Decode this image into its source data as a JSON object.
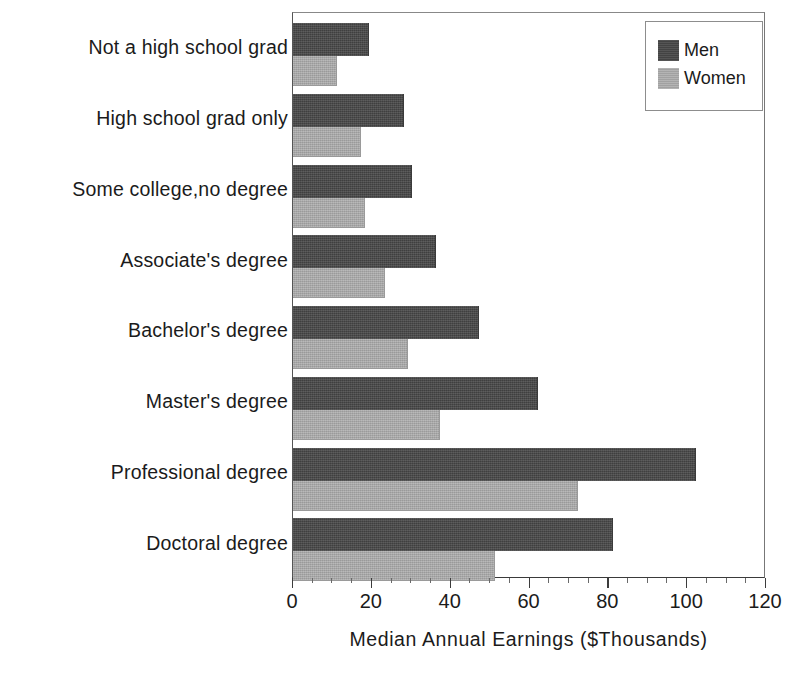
{
  "chart_data": {
    "type": "bar",
    "orientation": "horizontal",
    "title": "",
    "subtitle": "",
    "xlabel": "Median Annual Earnings  ($Thousands)",
    "ylabel": "",
    "xlim": [
      0,
      120
    ],
    "xticks": [
      0,
      20,
      40,
      60,
      80,
      100,
      120
    ],
    "xtick_labels": [
      "0",
      "20",
      "40",
      "60",
      "80",
      "100",
      "120"
    ],
    "minor_tick_interval": 5,
    "grid": false,
    "legend_position": "top-right",
    "categories": [
      "Not a high school grad",
      "High school grad only",
      "Some college,no degree",
      "Associate's degree",
      "Bachelor's degree",
      "Master's degree",
      "Professional degree",
      "Doctoral degree"
    ],
    "series": [
      {
        "name": "Men",
        "color": "#484848",
        "values": [
          19,
          28,
          30,
          36,
          47,
          62,
          102,
          81
        ]
      },
      {
        "name": "Women",
        "color": "#ababab",
        "values": [
          11,
          17,
          18,
          23,
          29,
          37,
          72,
          51
        ]
      }
    ]
  },
  "legend": {
    "entries": [
      {
        "label": "Men"
      },
      {
        "label": "Women"
      }
    ]
  },
  "axis": {
    "x_title": "Median Annual Earnings  ($Thousands)"
  }
}
